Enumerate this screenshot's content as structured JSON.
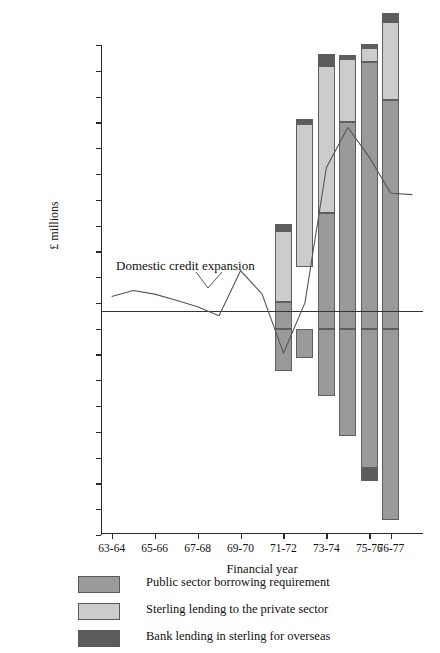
{
  "chart_data": {
    "type": "bar",
    "title": "",
    "subtitle": "",
    "xlabel": "Financial year",
    "ylabel": "£ millions",
    "categories": [
      "63-64",
      "65-66",
      "67-68",
      "69-70",
      "71-72",
      "73-74",
      "75-76",
      "76-77"
    ],
    "ylim": [
      -8000,
      11000
    ],
    "ytick_labels": [
      "11,000",
      "10,000",
      "9000",
      "8000",
      "7000",
      "6000",
      "5000",
      "4000",
      "3000",
      "2000",
      "1000",
      "0",
      "–1000",
      "–2000",
      "–3000",
      "–4000",
      "–5000",
      "–6000",
      "–7000",
      "–8000"
    ],
    "ytick_values": [
      11000,
      10000,
      9000,
      8000,
      7000,
      6000,
      5000,
      4000,
      3000,
      2000,
      1000,
      0,
      -1000,
      -2000,
      -3000,
      -4000,
      -5000,
      -6000,
      -7000,
      -8000
    ],
    "grid": false,
    "legend_position": "below",
    "stacked": true,
    "annotations": [
      {
        "text": "Domestic credit expansion",
        "x": "69-70",
        "y": 2500
      }
    ],
    "series": [
      {
        "name": "Public sector borrowing requirement",
        "color": "#9a9a9a",
        "type": "bar-segment",
        "bars": [
          {
            "category": "71-72",
            "from": 0,
            "to": 1050
          },
          {
            "category": "73-74",
            "from": 0,
            "to": 4500
          },
          {
            "category": "74-75",
            "from": 0,
            "to": 8000
          },
          {
            "category": "75-76",
            "from": 0,
            "to": 10350
          },
          {
            "category": "76-77",
            "from": 0,
            "to": 8850
          }
        ]
      },
      {
        "name": "Sterling lending to the private sector",
        "color": "#cccccc",
        "type": "bar-segment",
        "bars": [
          {
            "category": "71-72",
            "from": 1050,
            "to": 3800
          },
          {
            "category": "72-73",
            "from": 2400,
            "to": 7950
          },
          {
            "category": "73-74",
            "from": 4500,
            "to": 10200
          },
          {
            "category": "74-75",
            "from": 8000,
            "to": 10450
          },
          {
            "category": "75-76",
            "from": 10350,
            "to": 10900
          },
          {
            "category": "76-77",
            "from": 8850,
            "to": 11900
          }
        ]
      },
      {
        "name": "Bank lending in sterling for overseas",
        "color": "#5c5c5c",
        "type": "bar-segment",
        "bars": [
          {
            "category": "71-72",
            "from": 3800,
            "to": 4050
          },
          {
            "category": "72-73",
            "from": 7950,
            "to": 8150
          },
          {
            "category": "73-74",
            "from": 10200,
            "to": 10650
          },
          {
            "category": "74-75",
            "from": 10450,
            "to": 10600
          },
          {
            "category": "75-76",
            "from": 10900,
            "to": 11050
          },
          {
            "category": "76-77",
            "from": 11900,
            "to": 12250
          },
          {
            "category": "75-76neg",
            "from": -5900,
            "to": -5400
          }
        ]
      },
      {
        "name": "Domestic credit expansion",
        "color": "#555555",
        "type": "line",
        "points": [
          {
            "x": "63-64",
            "y": 1250
          },
          {
            "x": "64-65",
            "y": 1480
          },
          {
            "x": "65-66",
            "y": 1340
          },
          {
            "x": "66-67",
            "y": 1100
          },
          {
            "x": "67-68",
            "y": 850
          },
          {
            "x": "68-69",
            "y": 500
          },
          {
            "x": "69-70",
            "y": 2250
          },
          {
            "x": "70-71",
            "y": 1350
          },
          {
            "x": "71-72",
            "y": -950
          },
          {
            "x": "72-73",
            "y": 1000
          },
          {
            "x": "73-74",
            "y": 6250
          },
          {
            "x": "74-75",
            "y": 7800
          },
          {
            "x": "75-76",
            "y": 6650
          },
          {
            "x": "76-77",
            "y": 5250
          },
          {
            "x": "77-78",
            "y": 5200
          }
        ]
      }
    ],
    "negative_bars": [
      {
        "category": "71-72",
        "from": -1650,
        "to": 0,
        "color": "#9a9a9a"
      },
      {
        "category": "72-73",
        "from": -1150,
        "to": 0,
        "color": "#9a9a9a"
      },
      {
        "category": "73-74",
        "from": -2600,
        "to": 0,
        "color": "#9a9a9a"
      },
      {
        "category": "74-75",
        "from": -4150,
        "to": 0,
        "color": "#9a9a9a"
      },
      {
        "category": "75-76",
        "from": -5400,
        "to": 0,
        "color": "#9a9a9a"
      },
      {
        "category": "76-77",
        "from": -7400,
        "to": 0,
        "color": "#9a9a9a"
      }
    ]
  },
  "legend": {
    "items": [
      {
        "label": "Public sector borrowing requirement",
        "color": "#9a9a9a"
      },
      {
        "label": "Sterling lending to the private sector",
        "color": "#cccccc"
      },
      {
        "label": "Bank lending in sterling for overseas",
        "color": "#5c5c5c"
      }
    ]
  },
  "axes": {
    "y_title": "£ millions",
    "x_title": "Financial year"
  },
  "annotation": {
    "domestic_credit_expansion": "Domestic credit expansion"
  }
}
